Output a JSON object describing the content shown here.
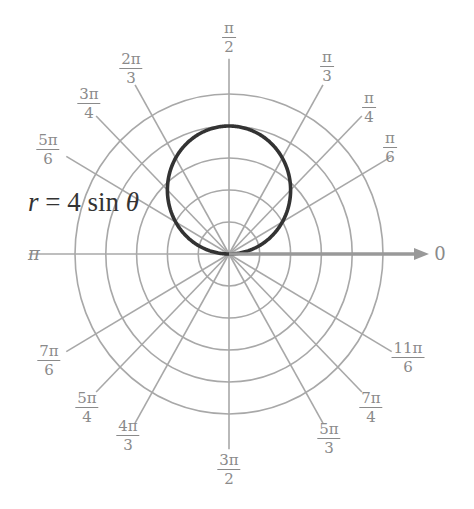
{
  "chart_data": {
    "type": "line",
    "coordinate_system": "polar",
    "title": "",
    "equation_label": "r = 4 sin θ",
    "series": [
      {
        "name": "r = 4 sin θ",
        "function": "r = 4*sin(theta)",
        "color": "#333333",
        "description": "circle of diameter 4 centered at (0, 2) in Cartesian coordinates",
        "points": [
          {
            "theta": "0",
            "r": 0
          },
          {
            "theta": "π/6",
            "r": 2
          },
          {
            "theta": "π/4",
            "r": 2.83
          },
          {
            "theta": "π/3",
            "r": 3.46
          },
          {
            "theta": "π/2",
            "r": 4
          },
          {
            "theta": "2π/3",
            "r": 3.46
          },
          {
            "theta": "3π/4",
            "r": 2.83
          },
          {
            "theta": "5π/6",
            "r": 2
          },
          {
            "theta": "π",
            "r": 0
          }
        ]
      }
    ],
    "radial_grid": {
      "circles": [
        1,
        2,
        3,
        4,
        5
      ],
      "rlim": [
        0,
        5
      ]
    },
    "angular_ticks": [
      {
        "angle_deg": 0,
        "label": "0"
      },
      {
        "angle_deg": 30,
        "label": "π/6",
        "num": "π",
        "den": "6"
      },
      {
        "angle_deg": 45,
        "label": "π/4",
        "num": "π",
        "den": "4"
      },
      {
        "angle_deg": 60,
        "label": "π/3",
        "num": "π",
        "den": "3"
      },
      {
        "angle_deg": 90,
        "label": "π/2",
        "num": "π",
        "den": "2"
      },
      {
        "angle_deg": 120,
        "label": "2π/3",
        "num": "2π",
        "den": "3"
      },
      {
        "angle_deg": 135,
        "label": "3π/4",
        "num": "3π",
        "den": "4"
      },
      {
        "angle_deg": 150,
        "label": "5π/6",
        "num": "5π",
        "den": "6"
      },
      {
        "angle_deg": 180,
        "label": "π"
      },
      {
        "angle_deg": 210,
        "label": "7π/6",
        "num": "7π",
        "den": "6"
      },
      {
        "angle_deg": 225,
        "label": "5π/4",
        "num": "5π",
        "den": "4"
      },
      {
        "angle_deg": 240,
        "label": "4π/3",
        "num": "4π",
        "den": "3"
      },
      {
        "angle_deg": 270,
        "label": "3π/2",
        "num": "3π",
        "den": "2"
      },
      {
        "angle_deg": 300,
        "label": "5π/3",
        "num": "5π",
        "den": "3"
      },
      {
        "angle_deg": 315,
        "label": "7π/4",
        "num": "7π",
        "den": "4"
      },
      {
        "angle_deg": 330,
        "label": "11π/6",
        "num": "11π",
        "den": "6"
      }
    ],
    "polar_axis_arrow": true,
    "grid": true,
    "legend": "none",
    "colors": {
      "grid": "#a8a8a8",
      "curve": "#333333",
      "axis_arrow": "#999999",
      "labels": "#8a8a8a"
    }
  }
}
